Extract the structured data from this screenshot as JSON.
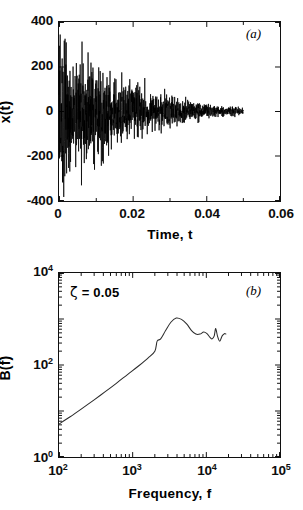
{
  "figure": {
    "panels": [
      {
        "tag": "(a)",
        "axes": {
          "xlabel": "Time, t",
          "ylabel": "x(t)",
          "xticks": [
            "0",
            "0.02",
            "0.04",
            "0.06"
          ],
          "yticks": [
            "400",
            "200",
            "0",
            "-200",
            "-400"
          ]
        }
      },
      {
        "tag": "(b)",
        "annotation": {
          "symbol": "ζ",
          "text": " = 0.05"
        },
        "axes": {
          "xlabel": "Frequency, f",
          "ylabel": "B(f)",
          "xticks": [
            "10",
            "10",
            "10",
            "10"
          ],
          "xtick_exponents": [
            "2",
            "3",
            "4",
            "5"
          ],
          "yticks": [
            "10",
            "10",
            "10"
          ],
          "ytick_exponents": [
            "0",
            "2",
            "4"
          ]
        }
      }
    ]
  },
  "chart_data": [
    {
      "type": "line",
      "panel": "(a)",
      "title": "",
      "xlabel": "Time, t",
      "ylabel": "x(t)",
      "xlim": [
        0,
        0.06
      ],
      "ylim": [
        -400,
        400
      ],
      "xticks": [
        0,
        0.02,
        0.04,
        0.06
      ],
      "yticks": [
        -400,
        -200,
        0,
        200,
        400
      ],
      "grid": false,
      "legend": null,
      "description": "Exponentially decaying broadband random vibration time history; signal spans t = 0 to t = 0.05 s, initial peaks near +345 and -385, decaying to near zero amplitude by t = 0.05.",
      "series": [
        {
          "name": "x(t)",
          "envelope_decay_rate": 90,
          "t_start": 0.0,
          "t_end": 0.05,
          "n_samples": 1400,
          "peak_positive": 345,
          "peak_negative": -385,
          "sample_envelope": [
            {
              "t": 0.0,
              "amp": 390
            },
            {
              "t": 0.005,
              "amp": 300
            },
            {
              "t": 0.01,
              "amp": 250
            },
            {
              "t": 0.015,
              "amp": 190
            },
            {
              "t": 0.02,
              "amp": 140
            },
            {
              "t": 0.025,
              "amp": 105
            },
            {
              "t": 0.03,
              "amp": 75
            },
            {
              "t": 0.035,
              "amp": 55
            },
            {
              "t": 0.04,
              "amp": 40
            },
            {
              "t": 0.045,
              "amp": 28
            },
            {
              "t": 0.05,
              "amp": 18
            }
          ]
        }
      ]
    },
    {
      "type": "line",
      "panel": "(b)",
      "title": "",
      "xlabel": "Frequency, f",
      "ylabel": "B(f)",
      "xscale": "log",
      "yscale": "log",
      "xlim": [
        100,
        100000
      ],
      "ylim": [
        1,
        10000
      ],
      "xticks": [
        100,
        1000,
        10000,
        100000
      ],
      "yticks": [
        1,
        100,
        10000
      ],
      "grid": false,
      "legend": null,
      "annotation": "ζ = 0.05",
      "description": "Log-log spectrum rising roughly as a power law from B=5 at f=100, flattening with a shoulder near f=2000, peaking around B=1050 at f=4000, then oscillating downward with ripples to f=1.8e4.",
      "points": [
        {
          "f": 100,
          "B": 5.2
        },
        {
          "f": 140,
          "B": 7.4
        },
        {
          "f": 200,
          "B": 11.0
        },
        {
          "f": 300,
          "B": 17.5
        },
        {
          "f": 420,
          "B": 26.0
        },
        {
          "f": 600,
          "B": 40.0
        },
        {
          "f": 850,
          "B": 62.0
        },
        {
          "f": 1200,
          "B": 95.0
        },
        {
          "f": 1600,
          "B": 140.0
        },
        {
          "f": 2000,
          "B": 200.0
        },
        {
          "f": 2150,
          "B": 330.0
        },
        {
          "f": 2400,
          "B": 370.0
        },
        {
          "f": 2800,
          "B": 560.0
        },
        {
          "f": 3300,
          "B": 850.0
        },
        {
          "f": 3900,
          "B": 1050.0
        },
        {
          "f": 4600,
          "B": 980.0
        },
        {
          "f": 5400,
          "B": 780.0
        },
        {
          "f": 6300,
          "B": 560.0
        },
        {
          "f": 7200,
          "B": 470.0
        },
        {
          "f": 8200,
          "B": 470.0
        },
        {
          "f": 9200,
          "B": 520.0
        },
        {
          "f": 10200,
          "B": 480.0
        },
        {
          "f": 11200,
          "B": 400.0
        },
        {
          "f": 12000,
          "B": 370.0
        },
        {
          "f": 12800,
          "B": 430.0
        },
        {
          "f": 13400,
          "B": 620.0
        },
        {
          "f": 14200,
          "B": 420.0
        },
        {
          "f": 15200,
          "B": 330.0
        },
        {
          "f": 16400,
          "B": 430.0
        },
        {
          "f": 17600,
          "B": 480.0
        },
        {
          "f": 18400,
          "B": 470.0
        }
      ]
    }
  ]
}
